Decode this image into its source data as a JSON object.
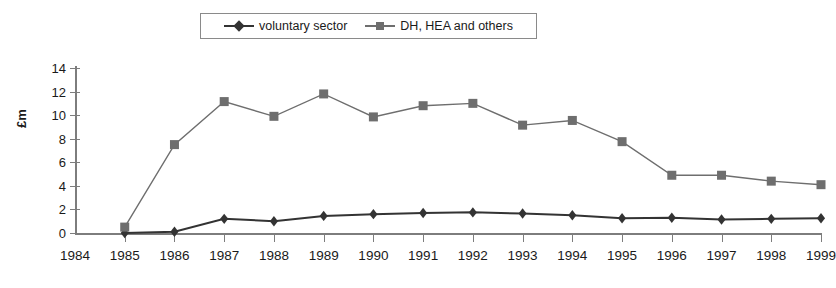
{
  "chart_data": {
    "type": "line",
    "title": "",
    "xlabel": "",
    "ylabel": "£m",
    "ylim": [
      0,
      14
    ],
    "ytick_step": 2,
    "yticks": [
      0,
      2,
      4,
      6,
      8,
      10,
      12,
      14
    ],
    "categories": [
      "1984",
      "1985",
      "1986",
      "1987",
      "1988",
      "1989",
      "1990",
      "1991",
      "1992",
      "1993",
      "1994",
      "1995",
      "1996",
      "1997",
      "1998",
      "1999"
    ],
    "grid": false,
    "legend_position": "top-center",
    "series": [
      {
        "name": "voluntary sector",
        "marker": "diamond",
        "color": "#333333",
        "values": [
          null,
          0.0,
          0.1,
          1.2,
          1.0,
          1.45,
          1.6,
          1.7,
          1.75,
          1.65,
          1.5,
          1.25,
          1.3,
          1.15,
          1.2,
          1.25
        ]
      },
      {
        "name": "DH, HEA and others",
        "marker": "square",
        "color": "#6e6e6e",
        "values": [
          null,
          0.5,
          7.5,
          11.15,
          9.9,
          11.8,
          9.85,
          10.8,
          11.0,
          9.15,
          9.55,
          7.75,
          4.9,
          4.9,
          4.4,
          4.1
        ]
      }
    ]
  },
  "legend": {
    "items": [
      {
        "label": "voluntary sector",
        "marker": "diamond"
      },
      {
        "label": "DH, HEA and others",
        "marker": "square"
      }
    ]
  },
  "icons": {
    "diamond_marker": "diamond-marker-icon",
    "square_marker": "square-marker-icon"
  }
}
